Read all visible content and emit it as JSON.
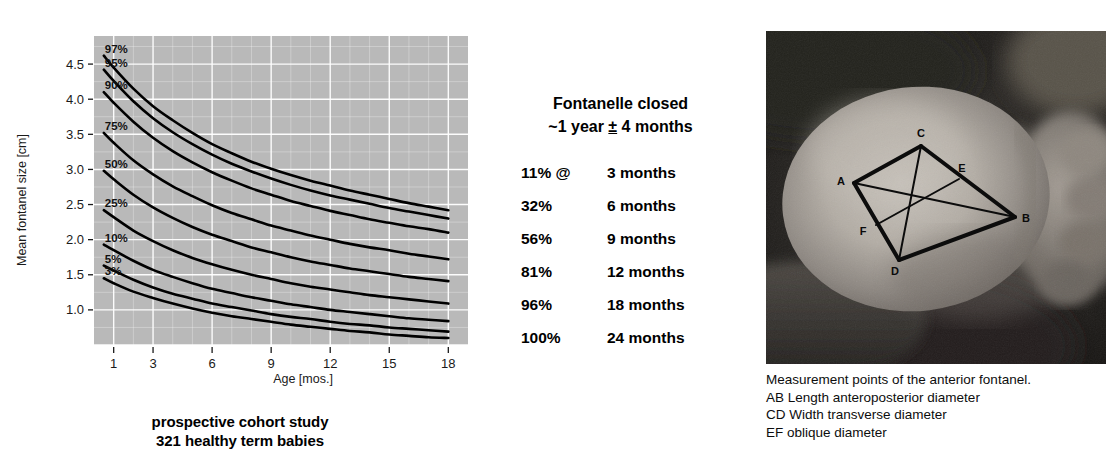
{
  "chart": {
    "y_axis_title": "Mean fontanel size [cm]",
    "x_axis_title": "Age [mos.]",
    "caption_line1": "prospective cohort study",
    "caption_line2": "321 healthy term babies"
  },
  "facts": {
    "heading_line1": "Fontanelle closed",
    "heading_prefix": "~1 year ",
    "heading_pm": "±",
    "heading_suffix": " 4 months",
    "rows": [
      {
        "pct": "11% @",
        "age": "3 months"
      },
      {
        "pct": "32%",
        "age": "6 months"
      },
      {
        "pct": "56%",
        "age": "9 months"
      },
      {
        "pct": "81%",
        "age": "12 months"
      },
      {
        "pct": "96%",
        "age": "18 months"
      },
      {
        "pct": "100%",
        "age": "24 months"
      }
    ]
  },
  "photo": {
    "points": [
      {
        "id": "A",
        "x": 88,
        "y": 152
      },
      {
        "id": "B",
        "x": 249,
        "y": 186
      },
      {
        "id": "C",
        "x": 155,
        "y": 115
      },
      {
        "id": "D",
        "x": 133,
        "y": 229
      },
      {
        "id": "E",
        "x": 193,
        "y": 148
      },
      {
        "id": "F",
        "x": 110,
        "y": 194
      }
    ],
    "caption": [
      "Measurement points of the anterior fontanel.",
      "AB Length anteroposterior diameter",
      "CD Width transverse diameter",
      "EF oblique diameter"
    ]
  },
  "chart_data": {
    "type": "line",
    "title": "",
    "xlabel": "Age [mos.]",
    "ylabel": "Mean fontanel size [cm]",
    "xlim": [
      0,
      19
    ],
    "ylim": [
      0.5,
      4.9
    ],
    "xticks": [
      1,
      3,
      6,
      9,
      12,
      15,
      18
    ],
    "yticks": [
      1.0,
      1.5,
      2.0,
      2.5,
      3.0,
      3.5,
      4.0,
      4.5
    ],
    "grid": true,
    "legend": "inline-left-labels",
    "plot_bg": "#b9b9b9",
    "grid_color": "#ffffff",
    "line_color": "#000000",
    "x": [
      0.5,
      1,
      2,
      3,
      4,
      5,
      6,
      7,
      8,
      9,
      10,
      11,
      12,
      13,
      14,
      15,
      16,
      17,
      18
    ],
    "series": [
      {
        "name": "97%",
        "label": "97%",
        "values": [
          4.62,
          4.45,
          4.15,
          3.9,
          3.7,
          3.52,
          3.36,
          3.23,
          3.11,
          3.01,
          2.92,
          2.84,
          2.77,
          2.7,
          2.64,
          2.58,
          2.52,
          2.47,
          2.42
        ]
      },
      {
        "name": "95%",
        "label": "95%",
        "values": [
          4.42,
          4.26,
          3.97,
          3.73,
          3.53,
          3.36,
          3.21,
          3.08,
          2.97,
          2.87,
          2.78,
          2.7,
          2.63,
          2.57,
          2.51,
          2.45,
          2.4,
          2.35,
          2.3
        ]
      },
      {
        "name": "90%",
        "label": "90%",
        "values": [
          4.1,
          3.95,
          3.68,
          3.45,
          3.26,
          3.1,
          2.96,
          2.84,
          2.73,
          2.64,
          2.55,
          2.48,
          2.41,
          2.35,
          2.29,
          2.24,
          2.19,
          2.15,
          2.1
        ]
      },
      {
        "name": "75%",
        "label": "75%",
        "values": [
          3.52,
          3.38,
          3.13,
          2.93,
          2.76,
          2.62,
          2.49,
          2.38,
          2.29,
          2.2,
          2.13,
          2.06,
          2.0,
          1.94,
          1.89,
          1.85,
          1.8,
          1.76,
          1.72
        ]
      },
      {
        "name": "50%",
        "label": "50%",
        "values": [
          2.98,
          2.86,
          2.64,
          2.46,
          2.31,
          2.18,
          2.07,
          1.98,
          1.89,
          1.82,
          1.75,
          1.69,
          1.64,
          1.59,
          1.55,
          1.51,
          1.47,
          1.44,
          1.41
        ]
      },
      {
        "name": "25%",
        "label": "25%",
        "values": [
          2.42,
          2.32,
          2.13,
          1.98,
          1.85,
          1.74,
          1.65,
          1.57,
          1.5,
          1.44,
          1.38,
          1.33,
          1.29,
          1.25,
          1.21,
          1.18,
          1.15,
          1.12,
          1.09
        ]
      },
      {
        "name": "10%",
        "label": "10%",
        "values": [
          1.93,
          1.85,
          1.7,
          1.57,
          1.47,
          1.38,
          1.3,
          1.24,
          1.18,
          1.13,
          1.08,
          1.04,
          1.0,
          0.97,
          0.94,
          0.91,
          0.88,
          0.86,
          0.84
        ]
      },
      {
        "name": "5%",
        "label": "5%",
        "values": [
          1.63,
          1.56,
          1.43,
          1.32,
          1.23,
          1.16,
          1.09,
          1.04,
          0.99,
          0.94,
          0.9,
          0.87,
          0.83,
          0.8,
          0.78,
          0.75,
          0.73,
          0.71,
          0.69
        ]
      },
      {
        "name": "3%",
        "label": "3%",
        "values": [
          1.45,
          1.38,
          1.26,
          1.17,
          1.09,
          1.02,
          0.96,
          0.91,
          0.87,
          0.83,
          0.79,
          0.76,
          0.73,
          0.7,
          0.68,
          0.65,
          0.63,
          0.61,
          0.6
        ]
      }
    ],
    "curve_label_positions": [
      {
        "label": "97%",
        "x": 0.5,
        "y": 4.62
      },
      {
        "label": "95%",
        "x": 0.5,
        "y": 4.42
      },
      {
        "label": "90%",
        "x": 0.5,
        "y": 4.1
      },
      {
        "label": "75%",
        "x": 0.5,
        "y": 3.52
      },
      {
        "label": "50%",
        "x": 0.5,
        "y": 2.98
      },
      {
        "label": "25%",
        "x": 0.5,
        "y": 2.42
      },
      {
        "label": "10%",
        "x": 0.5,
        "y": 1.93
      },
      {
        "label": "5%",
        "x": 0.5,
        "y": 1.63
      },
      {
        "label": "3%",
        "x": 0.5,
        "y": 1.45
      }
    ]
  }
}
